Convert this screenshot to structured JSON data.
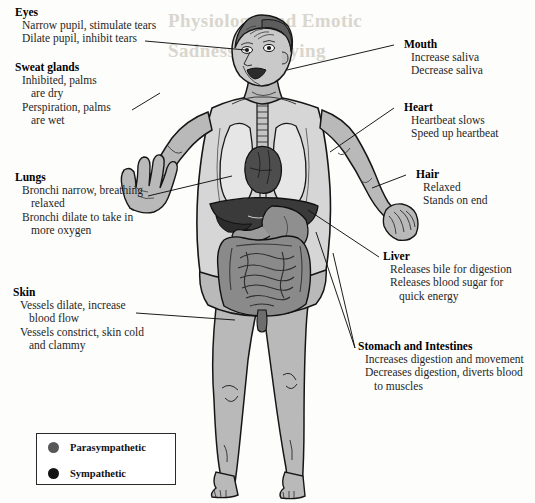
{
  "figure": {
    "title_ghost_line1": "Physiology and Emotic",
    "title_ghost_line2": "Sadness and Lying"
  },
  "callouts": [
    {
      "id": "eyes",
      "heading": "Eyes",
      "lines": [
        {
          "text": "Narrow pupil, stimulate tears",
          "indent": false
        },
        {
          "text": "Dilate pupil, inhibit tears",
          "indent": false
        }
      ]
    },
    {
      "id": "sweat-glands",
      "heading": "Sweat glands",
      "lines": [
        {
          "text": "Inhibited, palms",
          "indent": false
        },
        {
          "text": "are dry",
          "indent": true
        },
        {
          "text": "Perspiration, palms",
          "indent": false
        },
        {
          "text": "are wet",
          "indent": true
        }
      ]
    },
    {
      "id": "lungs",
      "heading": "Lungs",
      "lines": [
        {
          "text": "Bronchi narrow, breathing",
          "indent": false
        },
        {
          "text": "relaxed",
          "indent": true
        },
        {
          "text": "Bronchi dilate to take in",
          "indent": false
        },
        {
          "text": "more oxygen",
          "indent": true
        }
      ]
    },
    {
      "id": "skin",
      "heading": "Skin",
      "lines": [
        {
          "text": "Vessels dilate, increase",
          "indent": false
        },
        {
          "text": "blood flow",
          "indent": true
        },
        {
          "text": "Vessels constrict, skin cold",
          "indent": false
        },
        {
          "text": "and clammy",
          "indent": true
        }
      ]
    },
    {
      "id": "mouth",
      "heading": "Mouth",
      "lines": [
        {
          "text": "Increase saliva",
          "indent": false
        },
        {
          "text": "Decrease saliva",
          "indent": false
        }
      ]
    },
    {
      "id": "heart",
      "heading": "Heart",
      "lines": [
        {
          "text": "Heartbeat slows",
          "indent": false
        },
        {
          "text": "Speed up heartbeat",
          "indent": false
        }
      ]
    },
    {
      "id": "hair",
      "heading": "Hair",
      "lines": [
        {
          "text": "Relaxed",
          "indent": false
        },
        {
          "text": "Stands on end",
          "indent": false
        }
      ]
    },
    {
      "id": "liver",
      "heading": "Liver",
      "lines": [
        {
          "text": "Releases bile for digestion",
          "indent": false
        },
        {
          "text": "Releases blood sugar for",
          "indent": false
        },
        {
          "text": "quick energy",
          "indent": true
        }
      ]
    },
    {
      "id": "stomach-and-intestines",
      "heading": "Stomach and Intestines",
      "lines": [
        {
          "text": "Increases digestion and movement",
          "indent": false
        },
        {
          "text": "Decreases digestion, diverts blood",
          "indent": false
        },
        {
          "text": "to muscles",
          "indent": true
        }
      ]
    }
  ],
  "legend": {
    "items": [
      {
        "label": "Parasympathetic",
        "color": "#57575a",
        "marker": "filled-circle"
      },
      {
        "label": "Sympathetic",
        "color": "#141414",
        "marker": "filled-circle"
      }
    ]
  },
  "colors": {
    "skin": "#b9b9b9",
    "skin_light": "#d6d6d6",
    "hair": "#6e6e6e",
    "outline": "#161616",
    "heart": "#4d4d4d",
    "liver": "#3a3a3a",
    "stomach": "#8f8f8f",
    "intestines": "#8a8a8a",
    "lung": "#e6e6e6",
    "background": "#fdfdfb",
    "leader_line": "#111111",
    "ghost_text": "#d9d6ce"
  },
  "callout_text": {
    "eyes_heading": "Eyes",
    "eyes_l1": "Narrow pupil, stimulate tears",
    "eyes_l2": "Dilate pupil, inhibit tears",
    "sweat_heading": "Sweat glands",
    "sweat_l1": "Inhibited, palms",
    "sweat_l2": "are dry",
    "sweat_l3": "Perspiration, palms",
    "sweat_l4": "are wet",
    "lungs_heading": "Lungs",
    "lungs_l1": "Bronchi narrow, breathing",
    "lungs_l2": "relaxed",
    "lungs_l3": "Bronchi dilate to take in",
    "lungs_l4": "more oxygen",
    "skin_heading": "Skin",
    "skin_l1": "Vessels dilate, increase",
    "skin_l2": "blood flow",
    "skin_l3": "Vessels constrict, skin cold",
    "skin_l4": "and clammy",
    "mouth_heading": "Mouth",
    "mouth_l1": "Increase saliva",
    "mouth_l2": "Decrease saliva",
    "heart_heading": "Heart",
    "heart_l1": "Heartbeat slows",
    "heart_l2": "Speed up heartbeat",
    "hair_heading": "Hair",
    "hair_l1": "Relaxed",
    "hair_l2": "Stands on end",
    "liver_heading": "Liver",
    "liver_l1": "Releases bile for digestion",
    "liver_l2": "Releases blood sugar for",
    "liver_l3": "quick energy",
    "stomach_heading": "Stomach and Intestines",
    "stomach_l1": "Increases digestion and movement",
    "stomach_l2": "Decreases digestion, diverts blood",
    "stomach_l3": "to muscles",
    "legend_para": "Parasympathetic",
    "legend_symp": "Sympathetic",
    "ghost1": "Physiology and Emotic",
    "ghost2": "Sadness and Lying"
  }
}
